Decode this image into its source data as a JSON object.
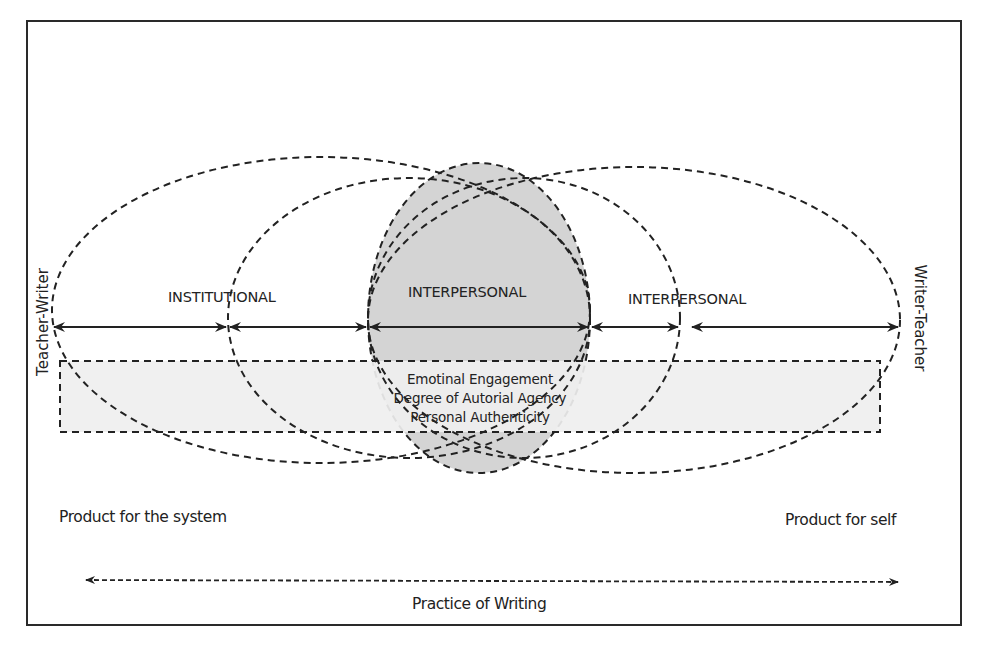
{
  "diagram": {
    "zones": {
      "left": "INSTITUTIONAL",
      "center": "INTERPERSONAL",
      "right": "INTERPERSONAL"
    },
    "axis_ends": {
      "left": "Teacher-Writer",
      "right": "Writer-Teacher"
    },
    "band_lines": [
      "Emotinal Engagement",
      "Degree of Autorial Agency",
      "Personal Authenticity"
    ],
    "products": {
      "left": "Product for the system",
      "right": "Product for self"
    },
    "practice_label": "Practice of Writing",
    "colors": {
      "frame": "#2a2a2a",
      "line": "#222222",
      "center_ellipse_fill": "#d4d4d4",
      "band_fill": "#efefef",
      "background": "#ffffff"
    }
  }
}
